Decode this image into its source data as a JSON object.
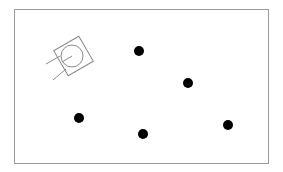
{
  "scene": {
    "frame": {
      "x": 14,
      "y": 9,
      "width": 255,
      "height": 155,
      "border_color": "#9a9a9a"
    },
    "robot": {
      "icon": "robot-topdown-icon",
      "center": {
        "x": 72,
        "y": 56
      },
      "body_size": 29,
      "rotation_deg": -30,
      "wheel_radius": 11,
      "stroke_color": "#8a8a8a"
    },
    "landmarks": [
      {
        "id": 1,
        "x": 139,
        "y": 51,
        "r": 5
      },
      {
        "id": 2,
        "x": 188,
        "y": 83,
        "r": 5
      },
      {
        "id": 3,
        "x": 79,
        "y": 118,
        "r": 5
      },
      {
        "id": 4,
        "x": 143,
        "y": 134,
        "r": 5
      },
      {
        "id": 5,
        "x": 228,
        "y": 125,
        "r": 5
      }
    ],
    "landmark_color": "#000000"
  }
}
